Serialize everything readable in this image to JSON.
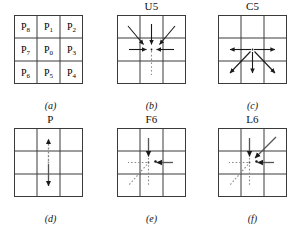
{
  "figure": {
    "background": "#ffffff",
    "line_color": "#3a3a3a",
    "arrow_color": "#1a1a1a",
    "dotted_color": "#8a8a8a"
  },
  "panels": [
    {
      "id": "a",
      "title": "",
      "caption": "(a)",
      "kind": "labels",
      "cells": [
        {
          "name": "P",
          "sub": "8"
        },
        {
          "name": "P",
          "sub": "1"
        },
        {
          "name": "P",
          "sub": "2"
        },
        {
          "name": "P",
          "sub": "7"
        },
        {
          "name": "P",
          "sub": "0"
        },
        {
          "name": "P",
          "sub": "3"
        },
        {
          "name": "P",
          "sub": "6"
        },
        {
          "name": "P",
          "sub": "5"
        },
        {
          "name": "P",
          "sub": "4"
        }
      ]
    },
    {
      "id": "b",
      "title": "U5",
      "caption": "(b)",
      "kind": "arrows",
      "description": "five arrows converge into the centre pixel from up-left, up, up-right, left and right; a dotted tail extends downward"
    },
    {
      "id": "c",
      "title": "C5",
      "caption": "(c)",
      "kind": "arrows",
      "description": "five arrows radiate outward from the centre pixel to left, right, down-left, down and down-right"
    },
    {
      "id": "d",
      "title": "P",
      "caption": "(d)",
      "kind": "arrows",
      "description": "a vertical double-headed arrow through the centre column"
    },
    {
      "id": "e",
      "title": "F6",
      "caption": "(e)",
      "kind": "arrows",
      "description": "solid arrows entering the centre from above and from the right; dotted lines leaving to the left, down-left and down"
    },
    {
      "id": "f",
      "title": "L6",
      "caption": "(f)",
      "kind": "arrows",
      "description": "solid arrows entering the centre from above, from up-right and from the right; dotted lines leaving to the left, down-left and down"
    }
  ]
}
